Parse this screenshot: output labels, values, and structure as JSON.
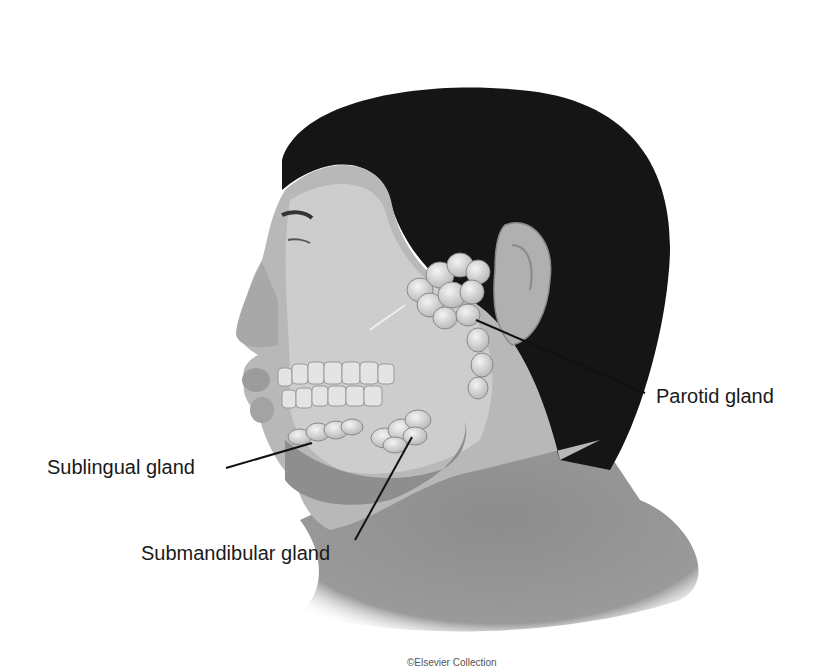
{
  "figure": {
    "labels": [
      {
        "id": "sublingual",
        "text": "Sublingual gland"
      },
      {
        "id": "submandibular",
        "text": "Submandibular gland"
      },
      {
        "id": "parotid",
        "text": "Parotid gland"
      }
    ],
    "caption": "©Elsevier Collection",
    "colors": {
      "background": "#ffffff",
      "skin": "#9a9a9a",
      "face_light": "#c8c8c8",
      "hair": "#151515",
      "gland": "#e6e6e6",
      "leader_line": "#111111",
      "label_text": "#1a1a1a"
    }
  }
}
